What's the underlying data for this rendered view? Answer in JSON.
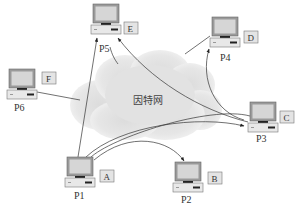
{
  "diagram": {
    "type": "network",
    "cloud": {
      "label": "因特网",
      "meaning": "Internet"
    },
    "nodes": [
      {
        "id": "P5",
        "label": "P5",
        "tag": "E"
      },
      {
        "id": "P4",
        "label": "P4",
        "tag": "D"
      },
      {
        "id": "P6",
        "label": "P6",
        "tag": "F"
      },
      {
        "id": "P3",
        "label": "P3",
        "tag": "C"
      },
      {
        "id": "P1",
        "label": "P1",
        "tag": "A"
      },
      {
        "id": "P2",
        "label": "P2",
        "tag": "B"
      }
    ],
    "edges": [
      {
        "from": "P1",
        "to": "P5",
        "style": "arrow"
      },
      {
        "from": "P1",
        "to": "P3",
        "style": "arrow-curved"
      },
      {
        "from": "P1",
        "to": "P2",
        "style": "arrow-curved"
      },
      {
        "from": "P3",
        "to": "P5",
        "style": "arrow-curved"
      },
      {
        "from": "P3",
        "to": "P4",
        "style": "arrow-curved"
      },
      {
        "from": "P6",
        "to": "cloud",
        "style": "line"
      },
      {
        "from": "P5",
        "to": "cloud",
        "style": "line"
      },
      {
        "from": "P4",
        "to": "cloud",
        "style": "line"
      }
    ],
    "colors": {
      "line": "#333333",
      "cloud": "#d8d8d8",
      "tag_bg": "#e4e4e4"
    }
  }
}
